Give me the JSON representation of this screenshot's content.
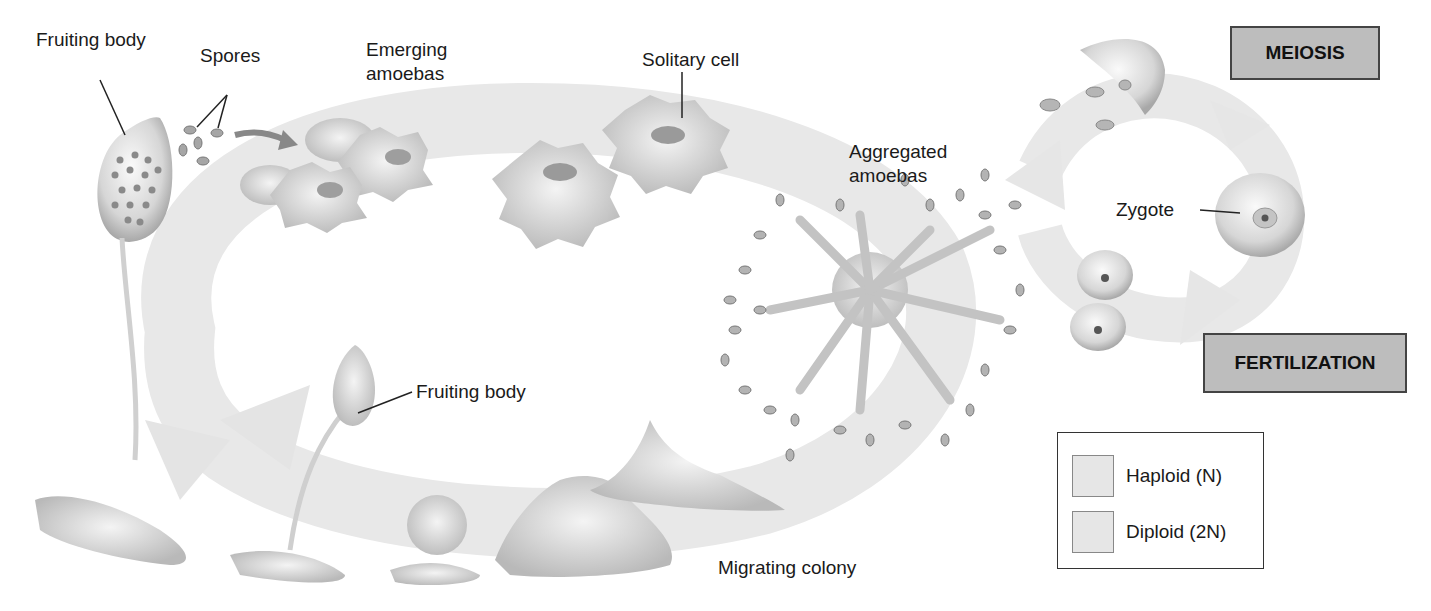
{
  "diagram": {
    "labels": {
      "fruiting_body_top": "Fruiting body",
      "spores": "Spores",
      "emerging_amoebas_line1": "Emerging",
      "emerging_amoebas_line2": "amoebas",
      "solitary_cell": "Solitary cell",
      "aggregated_amoebas_line1": "Aggregated",
      "aggregated_amoebas_line2": "amoebas",
      "zygote": "Zygote",
      "fruiting_body_bottom": "Fruiting body",
      "migrating_colony": "Migrating colony"
    },
    "stages": {
      "meiosis": "MEIOSIS",
      "fertilization": "FERTILIZATION"
    },
    "legend": {
      "items": [
        {
          "label": "Haploid (N)",
          "color": "#e6e6e6"
        },
        {
          "label": "Diploid (2N)",
          "color": "#e6e6e6"
        }
      ]
    },
    "colors": {
      "cycle_arrow": "#e8e8e8",
      "stage_box": "#bdbdbd",
      "cell_fill": "#d9d9d9"
    }
  }
}
